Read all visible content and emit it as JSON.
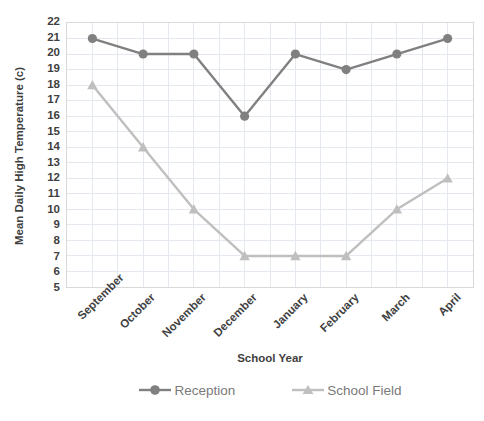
{
  "chart_data": {
    "type": "line",
    "title": "",
    "xlabel": "School Year",
    "ylabel": "Mean Daily High Temperature (c)",
    "categories": [
      "September",
      "October",
      "November",
      "December",
      "January",
      "February",
      "March",
      "April"
    ],
    "series": [
      {
        "name": "Reception",
        "marker": "circle",
        "color": "#808080",
        "values": [
          21,
          20,
          20,
          16,
          20,
          19,
          20,
          21
        ]
      },
      {
        "name": "School Field",
        "marker": "triangle",
        "color": "#bfbfbf",
        "values": [
          18,
          14,
          10,
          7,
          7,
          7,
          10,
          12
        ]
      }
    ],
    "ylim": [
      5,
      22
    ],
    "yticks": [
      5,
      6,
      7,
      8,
      9,
      10,
      11,
      12,
      13,
      14,
      15,
      16,
      17,
      18,
      19,
      20,
      21,
      22
    ],
    "grid": {
      "horizontal": true,
      "vertical": true,
      "minor_vertical_per_category": 2,
      "color": "#e4e9ef"
    },
    "legend": {
      "position": "bottom",
      "entries": [
        "Reception",
        "School Field"
      ]
    },
    "plot_border_color": "#d9d9d9",
    "text_color": "#3f3f3f"
  }
}
